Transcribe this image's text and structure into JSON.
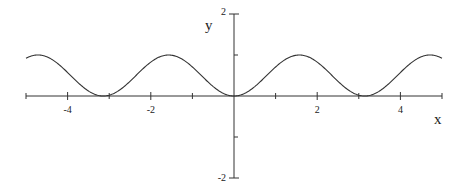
{
  "chart_data": {
    "type": "line",
    "title": "",
    "function": "sin(x)^2",
    "xlabel": "x",
    "ylabel": "y",
    "xlim": [
      -5,
      5
    ],
    "ylim": [
      -2,
      2
    ],
    "grid": false,
    "legend": null,
    "x_ticks": [
      -4,
      -2,
      2,
      4
    ],
    "x_tick_labels": [
      "-4",
      "-2",
      "2",
      "4"
    ],
    "x_minor_ticks": [
      -5,
      -3,
      -1,
      1,
      3,
      5
    ],
    "y_ticks": [
      2,
      -2
    ],
    "y_tick_labels": [
      "2",
      "-2"
    ],
    "y_minor_ticks": [
      1,
      -1
    ],
    "series": [
      {
        "name": "sin^2(x)",
        "color": "#333333",
        "x": [
          -5,
          -4.5,
          -4,
          -3.5,
          -3,
          -2.5,
          -2,
          -1.5,
          -1,
          -0.5,
          0,
          0.5,
          1,
          1.5,
          2,
          2.5,
          3,
          3.5,
          4,
          4.5,
          5
        ],
        "y": [
          0.92,
          0.96,
          0.57,
          0.12,
          0.02,
          0.36,
          0.83,
          0.99,
          0.71,
          0.23,
          0,
          0.23,
          0.71,
          0.99,
          0.83,
          0.36,
          0.02,
          0.12,
          0.57,
          0.96,
          0.92
        ]
      }
    ]
  },
  "colors": {
    "axis": "#333333",
    "curve": "#333333",
    "background": "#ffffff"
  }
}
